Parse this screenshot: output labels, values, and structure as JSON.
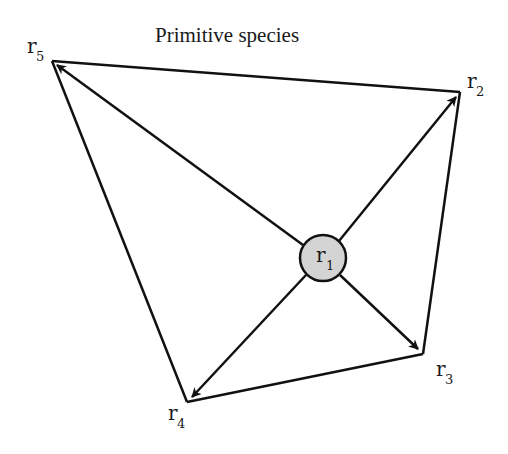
{
  "diagram": {
    "title": "Primitive species",
    "center_node": {
      "id": "r1",
      "label": "r",
      "subscript": "1",
      "fill": "#d4d4d4"
    },
    "outer_nodes": [
      {
        "id": "r2",
        "label": "r",
        "subscript": "2"
      },
      {
        "id": "r3",
        "label": "r",
        "subscript": "3"
      },
      {
        "id": "r4",
        "label": "r",
        "subscript": "4"
      },
      {
        "id": "r5",
        "label": "r",
        "subscript": "5"
      }
    ],
    "arrows": [
      {
        "from": "r1",
        "to": "r2"
      },
      {
        "from": "r1",
        "to": "r3"
      },
      {
        "from": "r1",
        "to": "r4"
      },
      {
        "from": "r1",
        "to": "r5"
      }
    ],
    "polygon_edges": [
      {
        "from": "r5",
        "to": "r2"
      },
      {
        "from": "r2",
        "to": "r3"
      },
      {
        "from": "r3",
        "to": "r4"
      },
      {
        "from": "r4",
        "to": "r5"
      }
    ],
    "colors": {
      "line": "#111111",
      "center_fill": "#d4d4d4"
    }
  }
}
